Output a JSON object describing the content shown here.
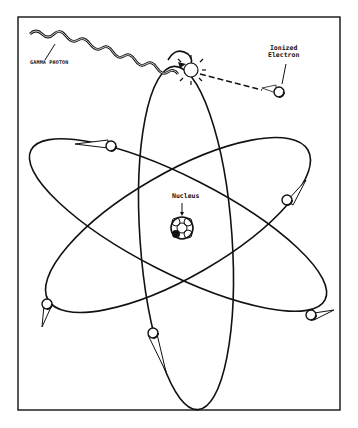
{
  "diagram": {
    "labels": {
      "gamma_photon": "GAMMA PHOTON",
      "ionized_electron_line1": "Ionized",
      "ionized_electron_line2": "Electron",
      "nucleus": "Nucleus"
    },
    "elements": [
      "frame",
      "gamma-photon-wave",
      "collision-burst",
      "ionized-electron",
      "electron-path",
      "nucleus",
      "orbit-1",
      "orbit-2",
      "orbit-3",
      "electron-1",
      "electron-2",
      "electron-3",
      "electron-4",
      "electron-5",
      "electron-6"
    ],
    "colors": {
      "ink": "#111111",
      "background": "#ffffff"
    }
  }
}
